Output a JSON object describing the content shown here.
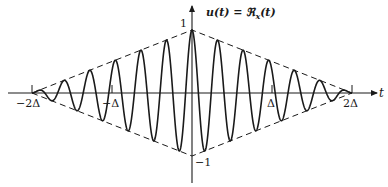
{
  "chart_data": {
    "type": "line",
    "xlabel": "t",
    "ylabel": "u(t)",
    "x_ticks": [
      {
        "value": -2,
        "label": "−2Δ"
      },
      {
        "value": -1,
        "label": "−Δ"
      },
      {
        "value": 1,
        "label": "Δ"
      },
      {
        "value": 2,
        "label": "2Δ"
      }
    ],
    "y_ticks": [
      {
        "value": 1,
        "label": "1"
      },
      {
        "value": -1,
        "label": "−1"
      }
    ],
    "xlim": [
      -2.3,
      2.3
    ],
    "ylim": [
      -1.4,
      1.4
    ],
    "grid": false,
    "legend": null,
    "series": [
      {
        "name": "u(t)",
        "style": "solid",
        "description": "cosine carrier modulated by triangular envelope",
        "formula": "(1 - |t|/(2Δ)) · cos(2π·t/T), T ≈ 0.32Δ",
        "carrier_period_in_delta": 0.32,
        "support": [
          -2,
          2
        ]
      },
      {
        "name": "upper envelope",
        "style": "dashed",
        "x": [
          -2,
          0,
          2
        ],
        "y": [
          0,
          1,
          0
        ]
      },
      {
        "name": "lower envelope",
        "style": "dashed",
        "x": [
          -2,
          0,
          2
        ],
        "y": [
          0,
          -1,
          0
        ]
      }
    ]
  },
  "labels": {
    "title": "u(t) = ℜ",
    "title_sub": "x",
    "title_tail": "(t)",
    "t_axis": "t",
    "y_one": "1",
    "y_minus_one": "−1",
    "x_m2": "−2Δ",
    "x_m1": "−Δ",
    "x_p1": "Δ",
    "x_p2": "2Δ"
  }
}
